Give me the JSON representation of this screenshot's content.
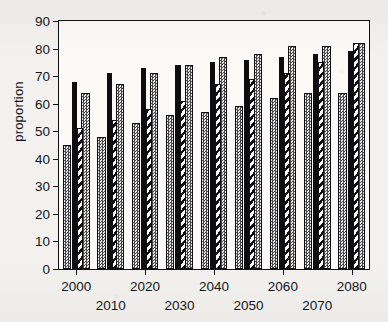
{
  "chart_data": {
    "type": "bar",
    "title": "",
    "xlabel": "",
    "ylabel": "proportion",
    "ylim": [
      0,
      90
    ],
    "yticks": [
      0,
      10,
      20,
      30,
      40,
      50,
      60,
      70,
      80,
      90
    ],
    "grid": false,
    "legend": "none",
    "categories": [
      "2000",
      "2010",
      "2020",
      "2030",
      "2040",
      "2050",
      "2060",
      "2070",
      "2080"
    ],
    "series": [
      {
        "name": "series-1",
        "pattern": "stipple",
        "values": [
          45,
          48,
          53,
          56,
          57,
          59,
          62,
          64,
          64
        ]
      },
      {
        "name": "series-2",
        "pattern": "solid-black",
        "values": [
          68,
          71,
          73,
          74,
          75,
          76,
          77,
          78,
          79
        ]
      },
      {
        "name": "series-3",
        "pattern": "diagonal-hatch",
        "values": [
          51,
          54,
          58,
          61,
          67,
          69,
          71,
          75,
          82
        ]
      }
    ],
    "series3_overlay": {
      "note": "each group also shows a taller stippled bar reaching the values below",
      "values": [
        64,
        67,
        71,
        74,
        77,
        78,
        81,
        81,
        82
      ]
    }
  },
  "axis": {
    "x_label_rows": [
      [
        "2000",
        "2020",
        "2040",
        "2060",
        "2080"
      ],
      [
        "2010",
        "2030",
        "2050",
        "2070"
      ]
    ]
  },
  "colors": {
    "ink": "#101014",
    "paper": "#f2f1ee",
    "plot_bg": "#fbfaf7",
    "bar_solid": "#0d0d10",
    "bar_stipple": "#cfcfcf"
  }
}
